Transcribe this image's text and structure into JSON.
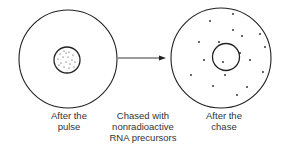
{
  "labels": {
    "left": [
      "After the",
      "pulse"
    ],
    "middle": [
      "Chased with",
      "nonradioactive",
      "RNA precursors"
    ],
    "right": [
      "After the",
      "chase"
    ]
  },
  "colors": {
    "stroke": "#222222",
    "text": "#333333"
  },
  "diagram": {
    "left_cell": {
      "description": "Cell with labeled RNA (dots) concentrated in nucleus"
    },
    "arrow": {
      "direction": "right"
    },
    "right_cell": {
      "description": "Cell with labeled RNA (dots) dispersed in cytoplasm"
    }
  }
}
